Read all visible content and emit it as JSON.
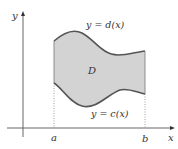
{
  "diagram": {
    "type": "region-between-curves",
    "axes": {
      "x_label": "x",
      "y_label": "y"
    },
    "bounds": {
      "left_label": "a",
      "right_label": "b"
    },
    "curves": {
      "upper_label": "y = d(x)",
      "lower_label": "y = c(x)"
    },
    "region": {
      "label": "D",
      "fill_color": "#d3d3d3",
      "stroke_color": "#555555"
    }
  }
}
